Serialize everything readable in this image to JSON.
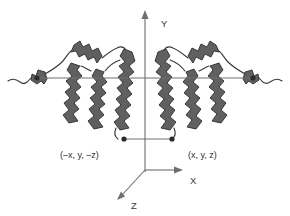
{
  "figure": {
    "type": "structural-diagram",
    "background_color": "#ffffff",
    "ribbon_fill_color": "#606060",
    "ribbon_outline_color": "#2e2e2e",
    "axis_color": "#6e6e6e",
    "marker_color": "#2b2b2b"
  },
  "axes": {
    "y": {
      "label": "Y",
      "label_x": 161,
      "label_y": 24,
      "direction": "up",
      "x": 145,
      "y_top": 14,
      "y_bottom": 172
    },
    "x": {
      "label": "X",
      "label_x": 190,
      "label_y": 183,
      "direction": "right",
      "origin_x": 145,
      "origin_y": 170,
      "end_x": 181,
      "end_y": 170
    },
    "z": {
      "label": "Z",
      "label_x": 132,
      "label_y": 207,
      "direction": "down-left",
      "origin_x": 145,
      "origin_y": 170,
      "end_x": 118,
      "end_y": 199
    }
  },
  "coordinate_labels": [
    {
      "name": "mirrored-coordinate-label",
      "text": "(–x, y, –z)",
      "x": 60,
      "y": 157,
      "side": "left"
    },
    {
      "name": "reference-coordinate-label",
      "text": "(x, y, z)",
      "x": 188,
      "y": 157,
      "side": "right"
    }
  ],
  "markers": [
    {
      "name": "lower-left-marker",
      "x": 124,
      "y": 139
    },
    {
      "name": "lower-right-marker",
      "x": 172,
      "y": 139
    },
    {
      "name": "upper-left-marker",
      "x": 37,
      "y": 78
    },
    {
      "name": "upper-right-marker",
      "x": 253,
      "y": 78
    }
  ],
  "connectors": [
    {
      "name": "horizontal-upper-connector",
      "x1": 37,
      "y1": 78,
      "x2": 253,
      "y2": 78
    },
    {
      "name": "horizontal-lower-connector",
      "x1": 124,
      "y1": 139,
      "x2": 172,
      "y2": 139
    }
  ],
  "structures": [
    {
      "name": "protein-structure-left",
      "label_ref": "(–x, y, –z)",
      "center_x": 88,
      "center_y": 95
    },
    {
      "name": "protein-structure-right",
      "label_ref": "(x, y, z)",
      "center_x": 202,
      "center_y": 95
    }
  ]
}
